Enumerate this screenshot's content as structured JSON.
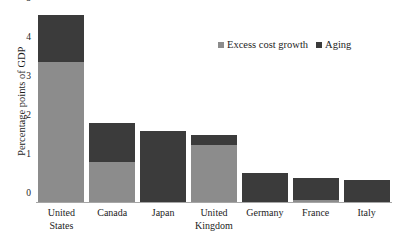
{
  "chart_data": {
    "type": "bar",
    "subtype": "stacked-vertical-bar",
    "title": "",
    "subtitle": "",
    "xlabel": "",
    "ylabel": "Percentage points of GDP",
    "categories": [
      "United States",
      "Canada",
      "Japan",
      "United Kingdom",
      "Germany",
      "France",
      "Italy"
    ],
    "category_lines": [
      [
        "United",
        "States"
      ],
      [
        "Canada"
      ],
      [
        "Japan"
      ],
      [
        "United",
        "Kingdom"
      ],
      [
        "Germany"
      ],
      [
        "France"
      ],
      [
        "Italy"
      ]
    ],
    "series": [
      {
        "name": "Excess cost growth",
        "color": "#8c8c8c",
        "values": [
          3.62,
          1.05,
          0.0,
          1.5,
          0.0,
          0.08,
          0.0
        ]
      },
      {
        "name": "Aging",
        "color": "#3b3b3b",
        "values": [
          1.21,
          1.0,
          1.85,
          0.25,
          0.78,
          0.55,
          0.58
        ]
      }
    ],
    "totals": [
      4.83,
      2.05,
      1.85,
      1.75,
      0.78,
      0.63,
      0.58
    ],
    "ylim": [
      0,
      5
    ],
    "yticks": [
      0,
      1,
      2,
      3,
      4,
      5
    ],
    "ytick_labels": [
      "0",
      "1",
      "2",
      "3",
      "4",
      "5"
    ],
    "grid": false,
    "legend_position": "top-right",
    "axis_line_color": "#a6a6a6",
    "background_color": "#ffffff",
    "text_color": "#1d1d1d"
  }
}
